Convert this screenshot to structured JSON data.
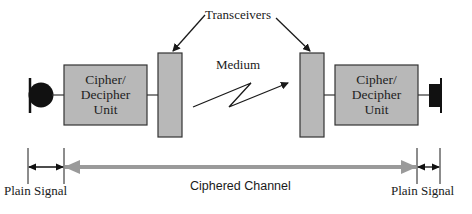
{
  "diagram": {
    "title_labels": {
      "transceivers": "Transceivers",
      "medium": "Medium"
    },
    "left_unit": {
      "line1": "Cipher/",
      "line2": "Decipher",
      "line3": "Unit"
    },
    "right_unit": {
      "line1": "Cipher/",
      "line2": "Decipher",
      "line3": "Unit"
    },
    "left_endpoint": {
      "shape": "microphone-icon"
    },
    "right_endpoint": {
      "shape": "speaker-icon"
    },
    "dimension_labels": {
      "left_plain": "Plain Signal",
      "channel": "Ciphered Channel",
      "right_plain": "Plain Signal"
    },
    "colors": {
      "box_fill": "#b8b8b8",
      "box_stroke": "#333333",
      "channel_arrow": "#9a9a9a",
      "endpoint": "#111111"
    }
  }
}
